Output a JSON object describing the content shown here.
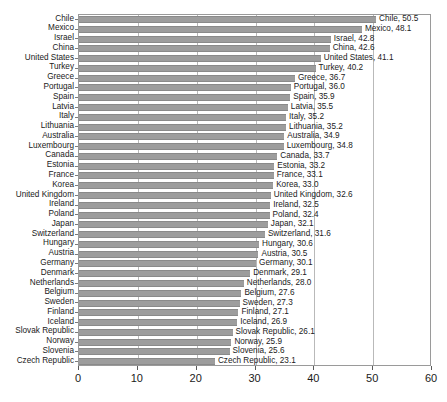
{
  "chart_data": {
    "type": "bar",
    "orientation": "horizontal",
    "title": "",
    "subtitle": "",
    "xlabel": "",
    "ylabel": "",
    "xlim": [
      0,
      60
    ],
    "xticks": [
      0,
      10,
      20,
      30,
      40,
      50,
      60
    ],
    "grid": true,
    "legend": "none",
    "series_name": "",
    "bar_color": "#9d9d9d",
    "categories": [
      "Chile",
      "Mexico",
      "Israel",
      "China",
      "United States",
      "Turkey",
      "Greece",
      "Portugal",
      "Spain",
      "Latvia",
      "Italy",
      "Lithuania",
      "Australia",
      "Luxembourg",
      "Canada",
      "Estonia",
      "France",
      "Korea",
      "United Kingdom",
      "Ireland",
      "Poland",
      "Japan",
      "Switzerland",
      "Hungary",
      "Austria",
      "Germany",
      "Denmark",
      "Netherlands",
      "Belgium",
      "Sweden",
      "Finland",
      "Iceland",
      "Slovak Republic",
      "Norway",
      "Slovenia",
      "Czech Republic"
    ],
    "values": [
      50.5,
      48.1,
      42.8,
      42.6,
      41.1,
      40.2,
      36.7,
      36.0,
      35.9,
      35.5,
      35.2,
      35.2,
      34.9,
      34.8,
      33.7,
      33.2,
      33.1,
      33.0,
      32.6,
      32.5,
      32.4,
      32.1,
      31.6,
      30.6,
      30.5,
      30.1,
      29.1,
      28.0,
      27.6,
      27.3,
      27.1,
      26.9,
      26.1,
      25.9,
      25.6,
      23.1
    ],
    "data_labels": [
      "Chile, 50.5",
      "Mexico, 48.1",
      "Israel, 42.8",
      "China, 42.6",
      "United States, 41.1",
      "Turkey, 40.2",
      "Greece, 36.7",
      "Portugal, 36.0",
      "Spain, 35.9",
      "Latvia, 35.5",
      "Italy, 35.2",
      "Lithuania, 35.2",
      "Australia, 34.9",
      "Luxembourg, 34.8",
      "Canada, 33.7",
      "Estonia, 33.2",
      "France, 33.1",
      "Korea, 33.0",
      "United Kingdom, 32.6",
      "Ireland, 32.5",
      "Poland, 32.4",
      "Japan, 32.1",
      "Switzerland, 31.6",
      "Hungary, 30.6",
      "Austria, 30.5",
      "Germany, 30.1",
      "Denmark, 29.1",
      "Netherlands, 28.0",
      "Belgium, 27.6",
      "Sweden, 27.3",
      "Finland, 27.1",
      "Iceland, 26.9",
      "Slovak Republic, 26.1",
      "Norway, 25.9",
      "Slovenia, 25.6",
      "Czech Republic, 23.1"
    ]
  }
}
